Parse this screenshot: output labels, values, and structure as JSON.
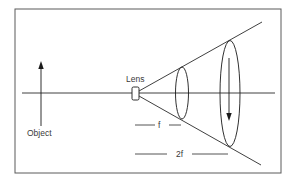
{
  "diagram": {
    "type": "optics-lens-cone",
    "labels": {
      "lens": "Lens",
      "object": "Object",
      "focal_length": "f",
      "double_focal_length": "2f"
    },
    "colors": {
      "stroke": "#2a2a2a",
      "frame": "#555555",
      "background": "#ffffff"
    }
  }
}
